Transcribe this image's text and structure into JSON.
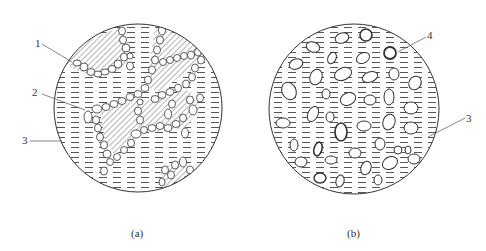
{
  "figure": {
    "panels": [
      {
        "id": "a",
        "caption": "(a)",
        "callouts": [
          {
            "label": "1",
            "target": "hatched-region"
          },
          {
            "label": "2",
            "target": "grain-boundary-particles"
          },
          {
            "label": "3",
            "target": "dashed-matrix"
          }
        ]
      },
      {
        "id": "b",
        "caption": "(b)",
        "callouts": [
          {
            "label": "4",
            "target": "dispersed-particle"
          },
          {
            "label": "3",
            "target": "dashed-matrix"
          }
        ]
      }
    ]
  },
  "colors": {
    "line": "#333333",
    "background": "#ffffff"
  }
}
